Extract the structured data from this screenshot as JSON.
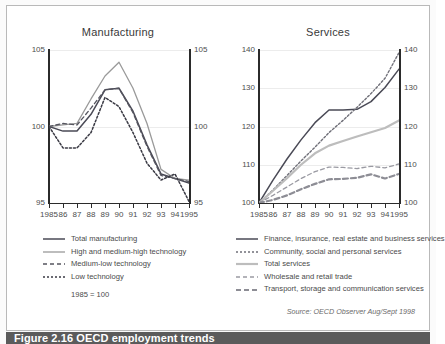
{
  "figure": {
    "caption": "Figure 2.16  OECD employment trends",
    "source": "Source: OECD Observer Aug/Sept 1998",
    "note": "1985 = 100"
  },
  "legend_left": [
    {
      "label": "Total manufacturing",
      "style": "solid",
      "color": "#4a4a56",
      "width": 1.5
    },
    {
      "label": "High and medium-high technology",
      "style": "solid",
      "color": "#9a9a9a",
      "width": 1.3
    },
    {
      "label": "Medium-low technology",
      "style": "dashed",
      "color": "#55555f",
      "width": 1.3
    },
    {
      "label": "Low technology",
      "style": "dotted",
      "color": "#3a3a44",
      "width": 1.5
    }
  ],
  "legend_right": [
    {
      "label": "Finance, insurance, real estate and business services",
      "style": "solid",
      "color": "#4a4a56",
      "width": 1.5
    },
    {
      "label": "Community, social and personal services",
      "style": "dotted",
      "color": "#6f6f78",
      "width": 1.4
    },
    {
      "label": "Total services",
      "style": "solid",
      "color": "#bdbdbd",
      "width": 2.2
    },
    {
      "label": "Wholesale and retail trade",
      "style": "dashed",
      "color": "#9a9aa2",
      "width": 1.3
    },
    {
      "label": "Transport, storage and communication services",
      "style": "dashed-thick",
      "color": "#8d8d95",
      "width": 2.2
    }
  ],
  "chart_data": [
    {
      "type": "line",
      "title": "Manufacturing",
      "xlabel": "",
      "ylabel": "",
      "note": "1985 = 100",
      "grid": true,
      "legend_position": "below",
      "x": [
        1985,
        1986,
        1987,
        1988,
        1989,
        1990,
        1991,
        1992,
        1993,
        1994,
        1995
      ],
      "xtick_labels": [
        "1985",
        "86",
        "87",
        "88",
        "89",
        "90",
        "91",
        "92",
        "93",
        "94",
        "1995"
      ],
      "ylim": [
        95,
        105
      ],
      "ytick_labels": [
        "95",
        "100",
        "105"
      ],
      "yticks": [
        95,
        100,
        105
      ],
      "series": [
        {
          "name": "Total manufacturing",
          "values": [
            100.0,
            99.7,
            99.7,
            100.8,
            102.4,
            102.5,
            101.0,
            98.8,
            96.9,
            96.6,
            96.3
          ]
        },
        {
          "name": "High and medium-high technology",
          "values": [
            100.0,
            100.1,
            100.2,
            101.8,
            103.3,
            104.2,
            102.5,
            100.2,
            97.2,
            96.6,
            96.5
          ]
        },
        {
          "name": "Medium-low technology",
          "values": [
            100.0,
            100.2,
            100.1,
            101.2,
            102.4,
            102.5,
            100.9,
            98.7,
            96.8,
            96.6,
            96.4
          ]
        },
        {
          "name": "Low technology",
          "values": [
            100.0,
            98.6,
            98.6,
            99.6,
            101.9,
            101.3,
            99.6,
            97.6,
            96.5,
            96.9,
            95.1
          ]
        }
      ]
    },
    {
      "type": "line",
      "title": "Services",
      "xlabel": "",
      "ylabel": "",
      "grid": true,
      "legend_position": "below",
      "x": [
        1985,
        1986,
        1987,
        1988,
        1989,
        1990,
        1991,
        1992,
        1993,
        1994,
        1995
      ],
      "xtick_labels": [
        "1985",
        "86",
        "87",
        "88",
        "89",
        "90",
        "91",
        "92",
        "93",
        "94",
        "1995"
      ],
      "ylim": [
        100,
        140
      ],
      "ytick_labels": [
        "100",
        "110",
        "120",
        "130",
        "140"
      ],
      "yticks": [
        100,
        110,
        120,
        130,
        140
      ],
      "series": [
        {
          "name": "Finance, insurance, real estate and business services",
          "values": [
            100.0,
            106.0,
            111.5,
            116.5,
            121.0,
            124.3,
            124.3,
            124.5,
            126.5,
            130.2,
            135.0
          ]
        },
        {
          "name": "Community, social and personal services",
          "values": [
            100.0,
            103.4,
            107.2,
            111.0,
            114.6,
            118.4,
            121.6,
            125.0,
            128.6,
            132.6,
            139.3
          ]
        },
        {
          "name": "Total services",
          "values": [
            100.0,
            103.2,
            106.5,
            110.0,
            113.0,
            115.0,
            116.2,
            117.4,
            118.5,
            119.6,
            121.6
          ]
        },
        {
          "name": "Wholesale and retail trade",
          "values": [
            100.0,
            102.0,
            104.2,
            106.4,
            108.2,
            109.4,
            109.3,
            109.0,
            109.6,
            109.2,
            110.2
          ]
        },
        {
          "name": "Transport, storage and communication services",
          "values": [
            100.0,
            100.8,
            102.0,
            103.6,
            105.0,
            106.2,
            106.3,
            106.6,
            107.5,
            106.4,
            107.6
          ]
        }
      ]
    }
  ]
}
